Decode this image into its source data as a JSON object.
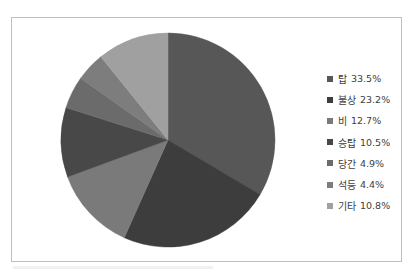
{
  "chart_data": {
    "type": "pie",
    "title": "",
    "categories": [
      "탑",
      "불상",
      "비",
      "승탑",
      "당간",
      "석등",
      "기타"
    ],
    "values": [
      33.5,
      23.2,
      12.7,
      10.5,
      4.9,
      4.4,
      10.8
    ],
    "unit": "%",
    "colors": [
      "#575757",
      "#3d3d3d",
      "#7a7a7a",
      "#484848",
      "#6b6b6b",
      "#7d7d7d",
      "#a0a0a0"
    ],
    "start_angle_deg": 0,
    "direction": "clockwise",
    "legend_position": "right"
  },
  "legend": {
    "items": [
      {
        "label": "탑",
        "value": "33.5%",
        "color": "#575757"
      },
      {
        "label": "불상",
        "value": "23.2%",
        "color": "#3d3d3d"
      },
      {
        "label": "비",
        "value": "12.7%",
        "color": "#7a7a7a"
      },
      {
        "label": "승탑",
        "value": "10.5%",
        "color": "#484848"
      },
      {
        "label": "당간",
        "value": "4.9%",
        "color": "#6b6b6b"
      },
      {
        "label": "석등",
        "value": "4.4%",
        "color": "#7d7d7d"
      },
      {
        "label": "기타",
        "value": "10.8%",
        "color": "#a0a0a0"
      }
    ]
  }
}
